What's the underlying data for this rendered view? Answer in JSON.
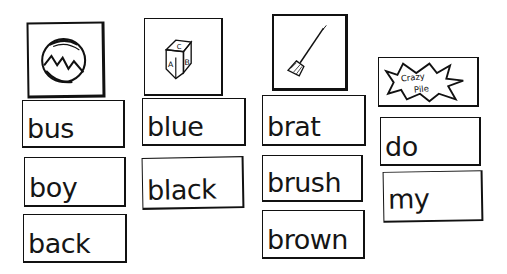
{
  "columns": [
    {
      "picture": {
        "name": "ball",
        "icon": "ball-icon"
      },
      "words": [
        "bus",
        "boy",
        "back"
      ]
    },
    {
      "picture": {
        "name": "block",
        "icon": "abc-block-icon",
        "letters": [
          "C",
          "A",
          "B"
        ]
      },
      "words": [
        "blue",
        "black"
      ]
    },
    {
      "picture": {
        "name": "broom",
        "icon": "broom-icon"
      },
      "words": [
        "brat",
        "brush",
        "brown"
      ]
    },
    {
      "picture": {
        "name": "crazy-pile",
        "icon": "crazy-pile-burst-icon",
        "label_line1": "Crazy",
        "label_line2": "Pile"
      },
      "words": [
        "do",
        "my"
      ]
    }
  ],
  "colors": {
    "ink": "#111111",
    "paper": "#ffffff"
  }
}
